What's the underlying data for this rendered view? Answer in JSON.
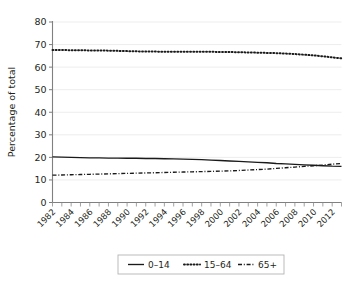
{
  "chart_data": {
    "type": "line",
    "title": "",
    "xlabel": "",
    "ylabel": "Percentage of total",
    "xlim": [
      1982,
      2013
    ],
    "ylim": [
      0,
      80
    ],
    "ytick_labels": [
      "0",
      "10",
      "20",
      "30",
      "40",
      "50",
      "60",
      "70",
      "80"
    ],
    "ytick_values": [
      0,
      10,
      20,
      30,
      40,
      50,
      60,
      70,
      80
    ],
    "xtick_labels": [
      "1982",
      "1984",
      "1986",
      "1988",
      "1990",
      "1992",
      "1994",
      "1996",
      "1998",
      "2000",
      "2002",
      "2004",
      "2006",
      "2008",
      "2010",
      "2012"
    ],
    "xtick_values": [
      1982,
      1984,
      1986,
      1988,
      1990,
      1992,
      1994,
      1996,
      1998,
      2000,
      2002,
      2004,
      2006,
      2008,
      2010,
      2012
    ],
    "x": [
      1982,
      1983,
      1984,
      1985,
      1986,
      1987,
      1988,
      1989,
      1990,
      1991,
      1992,
      1993,
      1994,
      1995,
      1996,
      1997,
      1998,
      1999,
      2000,
      2001,
      2002,
      2003,
      2004,
      2005,
      2006,
      2007,
      2008,
      2009,
      2010,
      2011,
      2012,
      2013
    ],
    "grid": true,
    "grid_axis": "y",
    "legend_position": "bottom-center",
    "series": [
      {
        "name": "0–14",
        "style": "solid",
        "color": "#1a1a1a",
        "values": [
          20.2,
          20.1,
          20.0,
          19.9,
          19.8,
          19.8,
          19.7,
          19.7,
          19.6,
          19.6,
          19.5,
          19.5,
          19.4,
          19.3,
          19.2,
          19.1,
          19.0,
          18.8,
          18.6,
          18.4,
          18.2,
          18.0,
          17.8,
          17.6,
          17.3,
          17.1,
          16.9,
          16.7,
          16.5,
          16.3,
          16.1,
          16.0
        ]
      },
      {
        "name": "15–64",
        "style": "dotted",
        "color": "#1a1a1a",
        "values": [
          67.6,
          67.6,
          67.5,
          67.5,
          67.4,
          67.4,
          67.3,
          67.2,
          67.1,
          67.0,
          66.9,
          66.9,
          66.8,
          66.8,
          66.8,
          66.8,
          66.8,
          66.8,
          66.7,
          66.7,
          66.6,
          66.5,
          66.4,
          66.3,
          66.2,
          66.0,
          65.8,
          65.5,
          65.2,
          64.8,
          64.3,
          63.9
        ]
      },
      {
        "name": "65+",
        "style": "dashdot",
        "color": "#1a1a1a",
        "values": [
          12.1,
          12.2,
          12.3,
          12.4,
          12.5,
          12.6,
          12.7,
          12.8,
          12.9,
          13.0,
          13.1,
          13.2,
          13.3,
          13.4,
          13.5,
          13.6,
          13.7,
          13.8,
          13.9,
          14.0,
          14.2,
          14.4,
          14.6,
          14.8,
          15.1,
          15.4,
          15.7,
          16.0,
          16.3,
          16.6,
          17.0,
          17.3
        ]
      }
    ]
  },
  "legend": {
    "items": [
      {
        "label": "0–14",
        "style": "solid"
      },
      {
        "label": "15–64",
        "style": "dotted"
      },
      {
        "label": "65+",
        "style": "dashdot"
      }
    ]
  },
  "axes": {
    "y_axis_title": "Percentage of total"
  }
}
